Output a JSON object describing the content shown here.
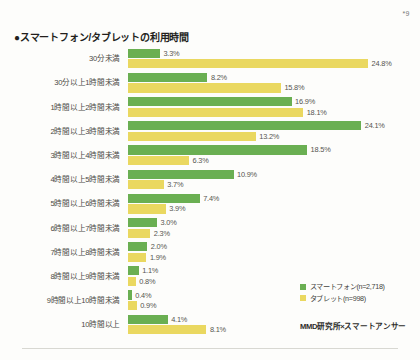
{
  "page_marker": "*9",
  "title": "●スマートフォン/タブレットの利用時間",
  "source": "MMD研究所×スマートアンサー",
  "legend": {
    "smartphone": "スマートフォン(n=2,718)",
    "tablet": "タブレット(n=998)"
  },
  "colors": {
    "smartphone": "#6aaf52",
    "tablet": "#ead860",
    "background": "#fdfdfb",
    "text": "#3a3a38"
  },
  "chart_data": {
    "type": "bar",
    "orientation": "horizontal",
    "title": "●スマートフォン/タブレットの利用時間",
    "xlabel": "",
    "ylabel": "",
    "grid": false,
    "legend_position": "bottom-right",
    "xlim": [
      0,
      25
    ],
    "value_suffix": "%",
    "categories": [
      "30分未満",
      "30分以上1時間未満",
      "1時間以上2時間未満",
      "2時間以上3時間未満",
      "3時間以上4時間未満",
      "4時間以上5時間未満",
      "5時間以上6時間未満",
      "6時間以上7時間未満",
      "7時間以上8時間未満",
      "8時間以上9時間未満",
      "9時間以上10時間未満",
      "10時間以上"
    ],
    "series": [
      {
        "name": "スマートフォン(n=2,718)",
        "color": "#6aaf52",
        "values": [
          3.3,
          8.2,
          16.9,
          24.1,
          18.5,
          10.9,
          7.4,
          3.0,
          2.0,
          1.1,
          0.4,
          4.1
        ],
        "labels": [
          "3.3%",
          "8.2%",
          "16.9%",
          "24.1%",
          "18.5%",
          "10.9%",
          "7.4%",
          "3.0%",
          "2.0%",
          "1.1%",
          "0.4%",
          "4.1%"
        ]
      },
      {
        "name": "タブレット(n=998)",
        "color": "#ead860",
        "values": [
          24.8,
          15.8,
          18.1,
          13.2,
          6.3,
          3.7,
          3.9,
          2.3,
          1.9,
          0.8,
          0.9,
          8.1
        ],
        "labels": [
          "24.8%",
          "15.8%",
          "18.1%",
          "13.2%",
          "6.3%",
          "3.7%",
          "3.9%",
          "2.3%",
          "1.9%",
          "0.8%",
          "0.9%",
          "8.1%"
        ]
      }
    ]
  }
}
